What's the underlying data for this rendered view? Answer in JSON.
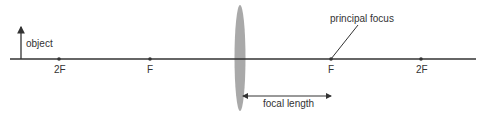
{
  "diagram": {
    "labels": {
      "object": "object",
      "principal_focus": "principal focus",
      "focal_length": "focal length",
      "left_2f": "2F",
      "left_f": "F",
      "right_f": "F",
      "right_2f": "2F"
    },
    "colors": {
      "axis": "#333333",
      "lens": "#a9a9a9",
      "text": "#333333"
    }
  }
}
